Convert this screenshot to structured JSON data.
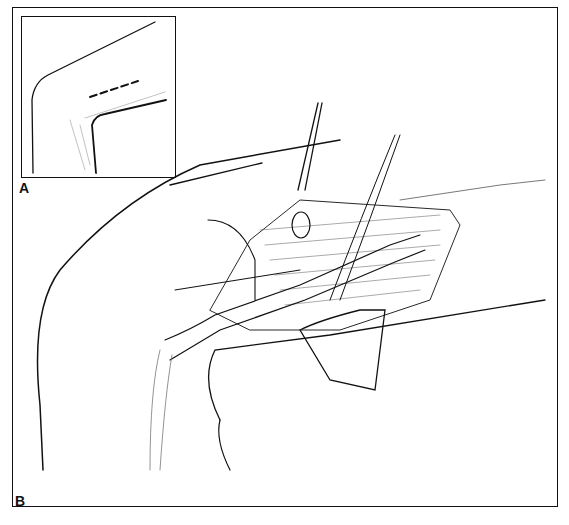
{
  "figure": {
    "panels": [
      {
        "id": "A",
        "label": "A",
        "description": "Inset: outline of limb at joint with dashed incision line"
      },
      {
        "id": "B",
        "label": "B",
        "description": "Surgical exposure with forceps, retractors and dissected vessel"
      }
    ],
    "colors": {
      "ink": "#111111",
      "paper": "#ffffff"
    }
  }
}
